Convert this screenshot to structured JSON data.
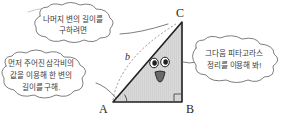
{
  "figure": {
    "background_color": "#ffffff",
    "ink_color": "#3a3a3a",
    "triangle_fill_color": "#d6d6d6",
    "triangle_stroke_color": "#1f1f1f"
  },
  "triangle": {
    "vertices": [
      {
        "name": "vertex-a",
        "label": "A",
        "position": "bottom-left"
      },
      {
        "name": "vertex-b",
        "label": "B",
        "position": "bottom-right"
      },
      {
        "name": "vertex-c",
        "label": "C",
        "position": "top-right"
      }
    ],
    "side_labels": [
      {
        "name": "hypotenuse",
        "label": "b"
      }
    ],
    "right_angle_at": "B",
    "marked_angle_at": "A"
  },
  "face": {
    "name": "triangle-face",
    "expression": "surprised",
    "eyes": 2,
    "mouth": "open"
  },
  "bubbles": [
    {
      "id": "bubble-top",
      "name": "speech-bubble-top",
      "shape": "cloud",
      "points_to": "C",
      "lines": [
        "나머지 변의 길이를",
        "구하려면"
      ],
      "text": "나머지 변의 길이를 구하려면"
    },
    {
      "id": "bubble-left",
      "name": "speech-bubble-left",
      "shape": "cloud",
      "points_to": "A",
      "lines": [
        "먼저 주어진 삼각비의",
        "값을 이용해 한 변의",
        "길이를 구해."
      ],
      "text": "먼저 주어진 삼각비의 값을 이용해 한 변의 길이를 구해."
    },
    {
      "id": "bubble-right",
      "name": "speech-bubble-right",
      "shape": "cloud",
      "points_to": "BC",
      "lines": [
        "그다음 피타고라스",
        "정리를 이용해 봐!"
      ],
      "text": "그다음 피타고라스 정리를 이용해 봐!"
    }
  ]
}
